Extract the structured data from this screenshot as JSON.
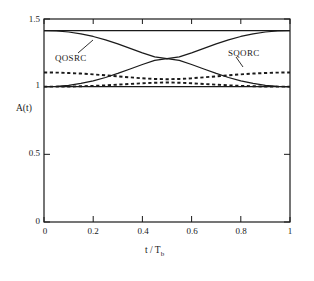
{
  "chart_data": {
    "type": "line",
    "title": "",
    "xlabel": "t / Tb",
    "ylabel": "A(t)",
    "xlim": [
      0,
      1
    ],
    "ylim": [
      0,
      1.5
    ],
    "grid": false,
    "legend_position": "inline-annotations",
    "xticks": [
      0,
      0.2,
      0.4,
      0.6,
      0.8,
      1
    ],
    "xtick_labels": [
      "0",
      "0.2",
      "0.4",
      "0.6",
      "0.8",
      "1"
    ],
    "yticks": [
      0,
      0.5,
      1,
      1.5
    ],
    "ytick_labels": [
      "0",
      "0.5",
      "1",
      "1.5"
    ],
    "annotations": [
      {
        "text": "QOSRC",
        "x": 0.17,
        "y": 1.27
      },
      {
        "text": "SQORC",
        "x": 0.74,
        "y": 1.24
      }
    ],
    "series": [
      {
        "name": "QOSRC upper envelope",
        "style": "solid",
        "x": [
          0,
          0.05,
          0.1,
          0.15,
          0.2,
          0.25,
          0.3,
          0.35,
          0.4,
          0.45,
          0.5,
          0.55,
          0.6,
          0.65,
          0.7,
          0.75,
          0.8,
          0.85,
          0.9,
          0.95,
          1
        ],
        "values": [
          1.414,
          1.414,
          1.414,
          1.414,
          1.414,
          1.414,
          1.414,
          1.414,
          1.414,
          1.414,
          1.414,
          1.414,
          1.414,
          1.414,
          1.414,
          1.414,
          1.414,
          1.414,
          1.414,
          1.414,
          1.414
        ]
      },
      {
        "name": "QOSRC lower envelope",
        "style": "solid",
        "x": [
          0,
          0.05,
          0.1,
          0.15,
          0.2,
          0.25,
          0.3,
          0.35,
          0.4,
          0.45,
          0.5,
          0.55,
          0.6,
          0.65,
          0.7,
          0.75,
          0.8,
          0.85,
          0.9,
          0.95,
          1
        ],
        "values": [
          1.0,
          1.0,
          1.0,
          1.0,
          1.0,
          1.0,
          1.0,
          1.0,
          1.0,
          1.0,
          1.0,
          1.0,
          1.0,
          1.0,
          1.0,
          1.0,
          1.0,
          1.0,
          1.0,
          1.0,
          1.0
        ]
      },
      {
        "name": "QOSRC descending",
        "style": "solid",
        "x": [
          0,
          0.05,
          0.1,
          0.15,
          0.2,
          0.25,
          0.3,
          0.35,
          0.4,
          0.45,
          0.5,
          0.55,
          0.6,
          0.65,
          0.7,
          0.75,
          0.8,
          0.85,
          0.9,
          0.95,
          1
        ],
        "values": [
          1.414,
          1.412,
          1.404,
          1.39,
          1.371,
          1.346,
          1.316,
          1.283,
          1.25,
          1.22,
          1.207,
          1.22,
          1.25,
          1.283,
          1.316,
          1.346,
          1.371,
          1.39,
          1.404,
          1.412,
          1.414
        ]
      },
      {
        "name": "QOSRC ascending",
        "style": "solid",
        "x": [
          0,
          0.05,
          0.1,
          0.15,
          0.2,
          0.25,
          0.3,
          0.35,
          0.4,
          0.45,
          0.5,
          0.55,
          0.6,
          0.65,
          0.7,
          0.75,
          0.8,
          0.85,
          0.9,
          0.95,
          1
        ],
        "values": [
          1.0,
          1.002,
          1.01,
          1.024,
          1.043,
          1.068,
          1.098,
          1.131,
          1.164,
          1.194,
          1.207,
          1.194,
          1.164,
          1.131,
          1.098,
          1.068,
          1.043,
          1.024,
          1.01,
          1.002,
          1.0
        ]
      },
      {
        "name": "SQORC upper",
        "style": "dashed",
        "x": [
          0,
          0.05,
          0.1,
          0.15,
          0.2,
          0.25,
          0.3,
          0.35,
          0.4,
          0.45,
          0.5,
          0.55,
          0.6,
          0.65,
          0.7,
          0.75,
          0.8,
          0.85,
          0.9,
          0.95,
          1
        ],
        "values": [
          1.105,
          1.104,
          1.101,
          1.097,
          1.091,
          1.084,
          1.076,
          1.069,
          1.062,
          1.057,
          1.055,
          1.057,
          1.062,
          1.069,
          1.076,
          1.084,
          1.091,
          1.097,
          1.101,
          1.104,
          1.105
        ]
      },
      {
        "name": "SQORC lower",
        "style": "dashed",
        "x": [
          0,
          0.05,
          0.1,
          0.15,
          0.2,
          0.25,
          0.3,
          0.35,
          0.4,
          0.45,
          0.5,
          0.55,
          0.6,
          0.65,
          0.7,
          0.75,
          0.8,
          0.85,
          0.9,
          0.95,
          1
        ],
        "values": [
          1.0,
          1.0,
          1.001,
          1.003,
          1.006,
          1.01,
          1.015,
          1.02,
          1.025,
          1.029,
          1.031,
          1.029,
          1.025,
          1.02,
          1.015,
          1.01,
          1.006,
          1.003,
          1.001,
          1.0,
          1.0
        ]
      }
    ]
  },
  "axes": {
    "y_label": "A(t)",
    "x_label_main": "t / T",
    "x_label_sub": "b",
    "y_ticks": [
      {
        "label": "1.5",
        "value": 1.5
      },
      {
        "label": "1",
        "value": 1.0
      },
      {
        "label": "0.5",
        "value": 0.5
      },
      {
        "label": "0",
        "value": 0
      }
    ],
    "x_ticks": [
      {
        "label": "0",
        "value": 0
      },
      {
        "label": "0.2",
        "value": 0.2
      },
      {
        "label": "0.4",
        "value": 0.4
      },
      {
        "label": "0.6",
        "value": 0.6
      },
      {
        "label": "0.8",
        "value": 0.8
      },
      {
        "label": "1",
        "value": 1
      }
    ]
  },
  "labels": {
    "qosrc": "QOSRC",
    "sqorc": "SQORC"
  },
  "colors": {
    "line": "#1a1a1a",
    "background": "#ffffff",
    "text": "#1a1a1a"
  }
}
